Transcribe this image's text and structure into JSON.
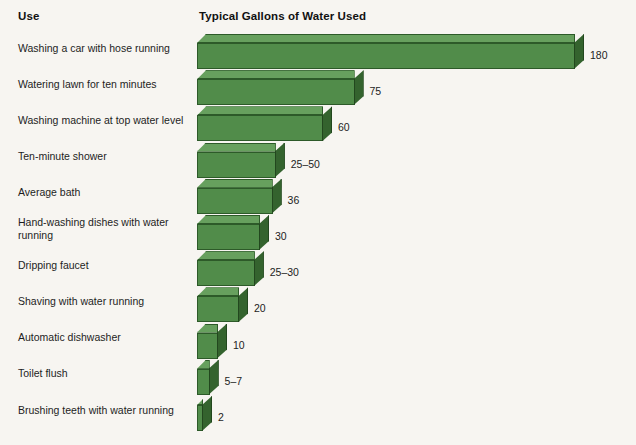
{
  "header": {
    "category_header": "Use",
    "value_header": "Typical Gallons of Water Used"
  },
  "colors": {
    "background": "#f7f5f1",
    "bar_front": "#518c4a",
    "bar_top": "#67a05e",
    "bar_side": "#34632e",
    "bar_outline": "#2d5a29",
    "text": "#1d1d1d"
  },
  "chart_data": {
    "type": "bar",
    "orientation": "horizontal",
    "style": "3d-extruded",
    "title": "Typical Gallons of Water Used",
    "xlabel": "",
    "ylabel": "Use",
    "xlim": [
      0,
      180
    ],
    "grid": false,
    "legend": null,
    "categories": [
      "Washing a car with hose running",
      "Watering lawn for ten minutes",
      "Washing machine at top water level",
      "Ten-minute shower",
      "Average bath",
      "Hand-washing dishes with water\nrunning",
      "Dripping faucet",
      "Shaving with water running",
      "Automatic dishwasher",
      "Toilet flush",
      "Brushing teeth with water running"
    ],
    "values": [
      180,
      75,
      60,
      37.5,
      36,
      30,
      27.5,
      20,
      10,
      6,
      2
    ],
    "value_labels": [
      "180",
      "75",
      "60",
      "25–50",
      "36",
      "30",
      "25–30",
      "20",
      "10",
      "5–7",
      "2"
    ]
  }
}
